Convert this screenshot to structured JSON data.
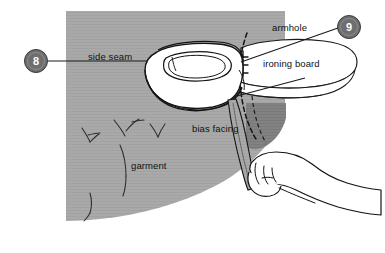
{
  "figure": {
    "width": 385,
    "height": 253,
    "background_color": "#ffffff"
  },
  "colors": {
    "garment_gray": "#a9a9a9",
    "garment_fold_dark_gray": "#828282",
    "badge_fill": "#6e6e6e",
    "badge_border": "#3a3a3a",
    "badge_text": "#ffffff",
    "line_color": "#1a1a1a",
    "white_fill": "#ffffff"
  },
  "badges": [
    {
      "id": "badge-8",
      "label": "8",
      "x": 24,
      "y": 49
    },
    {
      "id": "badge-9",
      "label": "9",
      "x": 337,
      "y": 15
    }
  ],
  "labels": [
    {
      "id": "label-side-seam",
      "text": "side seam",
      "x": 88,
      "y": 57
    },
    {
      "id": "label-armhole",
      "text": "armhole",
      "x": 272,
      "y": 28
    },
    {
      "id": "label-ironing-board",
      "text": "ironing board",
      "x": 263,
      "y": 64
    },
    {
      "id": "label-bias-facing",
      "text": "bias facing",
      "x": 192,
      "y": 129
    },
    {
      "id": "label-garment",
      "text": "garment",
      "x": 131,
      "y": 166
    }
  ],
  "parts": [
    {
      "id": "garment",
      "name": "garment"
    },
    {
      "id": "iron",
      "name": "iron"
    },
    {
      "id": "ironing-board",
      "name": "ironing board"
    },
    {
      "id": "bias-facing",
      "name": "bias facing"
    },
    {
      "id": "armhole-seam",
      "name": "armhole seam"
    },
    {
      "id": "side-seam",
      "name": "side seam"
    },
    {
      "id": "hand",
      "name": "hand"
    }
  ]
}
